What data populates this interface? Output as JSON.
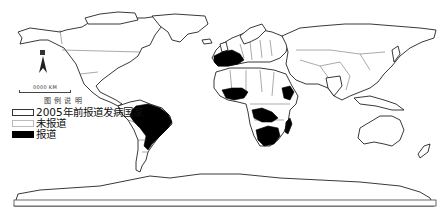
{
  "map": {
    "type": "world choropleth",
    "colors": {
      "reported": "#000000",
      "not_reported": "#ffffff",
      "outline": "#222222"
    },
    "reported_regions": [
      "Brazil",
      "Spain/France/Western Europe",
      "Nigeria region (West Africa)",
      "Central Africa (DRC/Angola area)",
      "Southern Africa",
      "Madagascar",
      "East Africa (Ethiopia/Somalia area)"
    ]
  },
  "north_arrow": {
    "icon": "north-arrow-icon"
  },
  "scale_bar": {
    "label": "0000 KM"
  },
  "legend": {
    "title": "图 例 说 明",
    "items": [
      {
        "label": "2005年前报道发病国家",
        "swatch": "outline"
      },
      {
        "label": "未报道",
        "swatch": "white"
      },
      {
        "label": "报道",
        "swatch": "black"
      }
    ]
  }
}
